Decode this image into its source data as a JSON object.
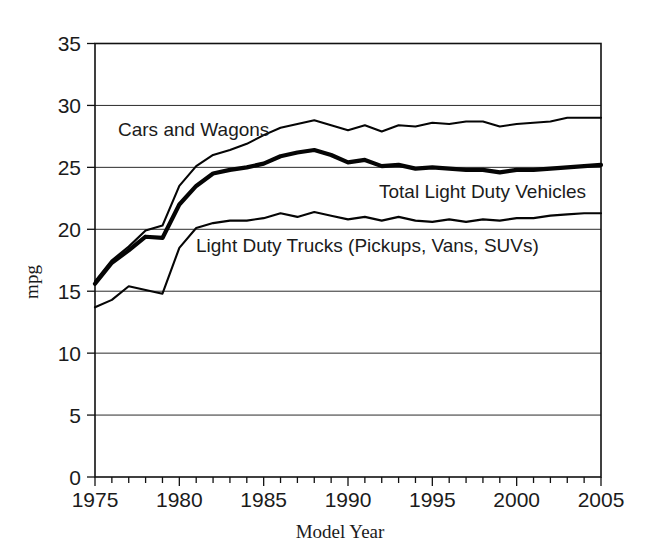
{
  "chart_data": {
    "type": "line",
    "title": "",
    "xlabel": "Model Year",
    "ylabel": "mpg",
    "xlim": [
      1975,
      2005
    ],
    "ylim": [
      0,
      35
    ],
    "grid": true,
    "legend_position": "inline-annotations",
    "y_ticks": [
      "0",
      "5",
      "10",
      "15",
      "20",
      "25",
      "30",
      "35"
    ],
    "y_tick_values": [
      0,
      5,
      10,
      15,
      20,
      25,
      30,
      35
    ],
    "x_ticks": [
      "1975",
      "1980",
      "1985",
      "1990",
      "1995",
      "2000",
      "2005"
    ],
    "x_tick_values": [
      1975,
      1980,
      1985,
      1990,
      1995,
      2000,
      2005
    ],
    "x_minor_tick_step": 1,
    "x": [
      1975,
      1976,
      1977,
      1978,
      1979,
      1980,
      1981,
      1982,
      1983,
      1984,
      1985,
      1986,
      1987,
      1988,
      1989,
      1990,
      1991,
      1992,
      1993,
      1994,
      1995,
      1996,
      1997,
      1998,
      1999,
      2000,
      2001,
      2002,
      2003,
      2004,
      2005
    ],
    "series": [
      {
        "name": "Cars and Wagons",
        "style": "thin",
        "values": [
          15.8,
          17.5,
          18.6,
          19.9,
          20.3,
          23.5,
          25.1,
          26.0,
          26.4,
          26.9,
          27.6,
          28.2,
          28.5,
          28.8,
          28.4,
          28.0,
          28.4,
          27.9,
          28.4,
          28.3,
          28.6,
          28.5,
          28.7,
          28.7,
          28.3,
          28.5,
          28.6,
          28.7,
          29.0,
          29.0,
          29.0
        ]
      },
      {
        "name": "Total Light Duty Vehicles",
        "style": "thick",
        "values": [
          15.6,
          17.3,
          18.3,
          19.4,
          19.3,
          22.0,
          23.5,
          24.5,
          24.8,
          25.0,
          25.3,
          25.9,
          26.2,
          26.4,
          26.0,
          25.4,
          25.6,
          25.1,
          25.2,
          24.9,
          25.0,
          24.9,
          24.8,
          24.8,
          24.6,
          24.8,
          24.8,
          24.9,
          25.0,
          25.1,
          25.2
        ]
      },
      {
        "name": "Light Duty Trucks (Pickups, Vans, SUVs)",
        "style": "thin",
        "values": [
          13.7,
          14.3,
          15.4,
          15.1,
          14.8,
          18.5,
          20.1,
          20.5,
          20.7,
          20.7,
          20.9,
          21.3,
          21.0,
          21.4,
          21.1,
          20.8,
          21.0,
          20.7,
          21.0,
          20.7,
          20.6,
          20.8,
          20.6,
          20.8,
          20.7,
          20.9,
          20.9,
          21.1,
          21.2,
          21.3,
          21.3
        ]
      }
    ],
    "annotations": [
      {
        "text": "Cars and Wagons",
        "x_px": 118,
        "y_px": 136
      },
      {
        "text": "Total Light Duty Vehicles",
        "x_px": 379,
        "y_px": 198
      },
      {
        "text": "Light Duty Trucks (Pickups, Vans, SUVs)",
        "x_px": 196,
        "y_px": 252
      }
    ],
    "colors": {
      "line": "#050505",
      "grid": "#2b2b2b",
      "frame": "#111111",
      "background": "#ffffff",
      "text": "#1b1b1b"
    }
  }
}
